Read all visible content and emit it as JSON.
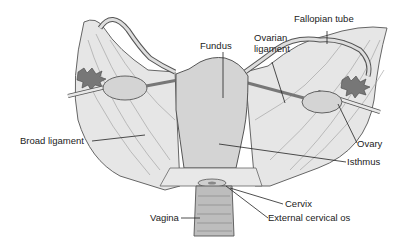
{
  "colors": {
    "tissue": "#e4e4e4",
    "tissue_dark": "#cfcfcf",
    "uterus": "#d2d2d2",
    "outline": "#555555",
    "leader": "#222222",
    "fimbriae": "#6e6e6e"
  },
  "labels": {
    "fundus": "Fundus",
    "ovarian_ligament_line1": "Ovarian",
    "ovarian_ligament_line2": "ligament",
    "fallopian_tube": "Fallopian tube",
    "broad_ligament": "Broad ligament",
    "ovary": "Ovary",
    "isthmus": "Isthmus",
    "cervix": "Cervix",
    "vagina": "Vagina",
    "external_cervical_os": "External cervical os"
  }
}
